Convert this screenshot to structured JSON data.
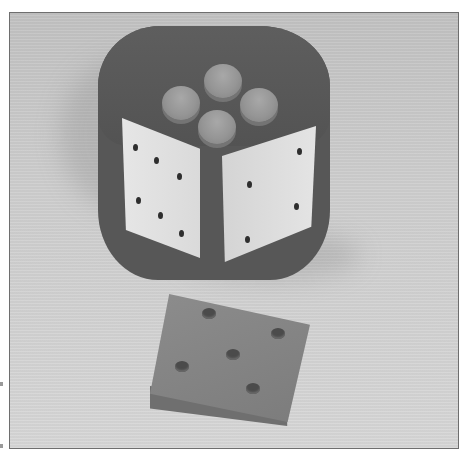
{
  "image": {
    "description": "Grayscale photograph of a wooden puzzle die: a dark cube with four raised round pegs on top, light square tiles with drilled pips on two visible sides, and a loose dark tile with five pip holes in front",
    "width": 467,
    "height": 464,
    "frame": {
      "border_color": "#6e6e6e",
      "background": "#cfcfcf"
    },
    "die": {
      "body_color": "#575757",
      "top_pegs": 4,
      "left_face_pips": 6,
      "right_face_pips": 4
    },
    "loose_tile": {
      "color": "#858585",
      "pips": 5
    }
  }
}
